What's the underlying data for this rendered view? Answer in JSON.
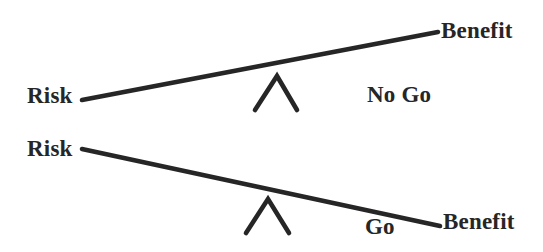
{
  "figure": {
    "background_color": "#ffffff",
    "ink_color": "#262626",
    "width": 543,
    "height": 252
  },
  "scales": {
    "top": {
      "decision": "No Go",
      "left_label": "Risk",
      "right_label": "Benefit",
      "tilt": "right-side-up",
      "heavier_side": "left",
      "beam": {
        "x1": 82,
        "y1": 100,
        "x2": 438,
        "y2": 32
      },
      "fulcrum": {
        "apex_x": 277,
        "apex_y": 76,
        "left_x": 255,
        "right_x": 297,
        "base_y": 110
      }
    },
    "bottom": {
      "decision": "Go",
      "left_label": "Risk",
      "right_label": "Benefit",
      "tilt": "right-side-down",
      "heavier_side": "right",
      "beam": {
        "x1": 82,
        "y1": 149,
        "x2": 440,
        "y2": 226
      },
      "fulcrum": {
        "apex_x": 268,
        "apex_y": 199,
        "left_x": 246,
        "right_x": 289,
        "base_y": 233
      }
    }
  },
  "labels": {
    "risk_top": "Risk",
    "benefit_top": "Benefit",
    "no_go": "No Go",
    "risk_bottom": "Risk",
    "go": "Go",
    "benefit_bottom": "Benefit"
  }
}
